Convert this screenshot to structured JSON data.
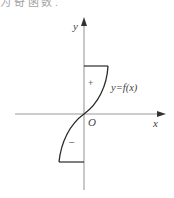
{
  "header": {
    "cut_off_text": "为 奇 函 数 ."
  },
  "diagram": {
    "axes": {
      "x_label": "x",
      "y_label": "y",
      "origin_label": "O"
    },
    "curve_label": "y=f(x)",
    "regions": {
      "positive_sign": "+",
      "negative_sign": "−"
    },
    "colors": {
      "axis": "#9a9a9a",
      "curve": "#2a2a2a",
      "text": "#444444"
    }
  }
}
